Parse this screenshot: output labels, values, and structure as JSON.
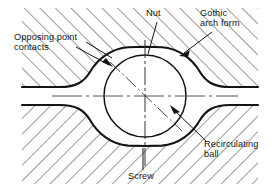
{
  "figure": {
    "type": "engineering-cross-section-diagram",
    "width": 277,
    "height": 189,
    "background_color": "#ffffff",
    "line_color": "#141414",
    "hatch_color": "#3a3a3a"
  },
  "labels": {
    "nut": "Nut",
    "gothic_arch_form": "Gothic\narch form",
    "opposing_point_contacts": "Opposing point\ncontacts",
    "recirculating_ball": "Recirculating\nball",
    "screw": "Screw"
  },
  "geometry": {
    "ball": {
      "center_x": 145,
      "center_y": 96,
      "radius": 41
    },
    "gothic_arch": {
      "cusp_top_y": 47,
      "cusp_bottom_y": 146,
      "left_flare_x": 88,
      "right_flare_x": 202
    },
    "centerline_vertical_x": 145,
    "centerline_horizontal_y": 96,
    "contact_axis_angle_deg": 45,
    "hatch_angle_deg": 45,
    "land_left_x": 22,
    "land_right_x": 258
  },
  "annotations": [
    {
      "name": "nut",
      "leader_from": [
        158,
        24
      ],
      "leader_to": [
        150,
        52
      ]
    },
    {
      "name": "gothic-arch-form",
      "leader_from": [
        205,
        30
      ],
      "leader_to": [
        179,
        52
      ]
    },
    {
      "name": "opposing-point-contacts",
      "leader_from": [
        80,
        44
      ],
      "leader_to": [
        112,
        64
      ]
    },
    {
      "name": "recirculating-ball",
      "leader_from": [
        205,
        140
      ],
      "leader_to": [
        172,
        110
      ]
    },
    {
      "name": "screw",
      "leader_from": [
        143,
        168
      ],
      "leader_to": [
        143,
        150
      ]
    }
  ]
}
